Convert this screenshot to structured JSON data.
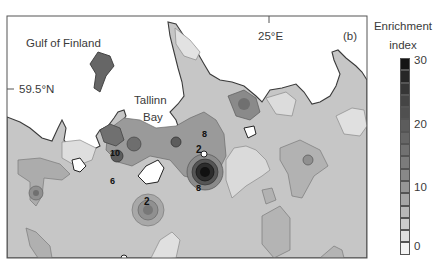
{
  "figure": {
    "panel_label": "(b)"
  },
  "map": {
    "place_labels": {
      "sea": "Gulf of Finland",
      "bay_line1": "Tallinn",
      "bay_line2": "Bay"
    },
    "axes": {
      "latitude_tick": "59.5°N",
      "longitude_tick": "25°E"
    },
    "contour_labels": [
      "2",
      "2",
      "2",
      "2",
      "2",
      "2",
      "4",
      "4",
      "4",
      "4",
      "4",
      "4",
      "6",
      "6",
      "6",
      "8",
      "8",
      "8",
      "10",
      "2"
    ],
    "colors": {
      "land_base": "#c8c8c8",
      "sea": "#ffffff",
      "coastline": "#3c3c3c",
      "contour_line": "#6e6e6e",
      "max_enrichment": "#111111"
    }
  },
  "colorbar": {
    "title_line1": "Enrichment",
    "title_line2": "index",
    "ticks": [
      "30",
      "20",
      "10",
      "0"
    ],
    "range": [
      0,
      30
    ],
    "levels": 16,
    "colors": [
      "#141414",
      "#262626",
      "#363636",
      "#454545",
      "#505050",
      "#5c5c5c",
      "#666666",
      "#717171",
      "#7c7c7c",
      "#888888",
      "#969696",
      "#a6a6a6",
      "#b8b8b8",
      "#cbcbcb",
      "#dfdfdf",
      "#f3f3f3"
    ]
  }
}
